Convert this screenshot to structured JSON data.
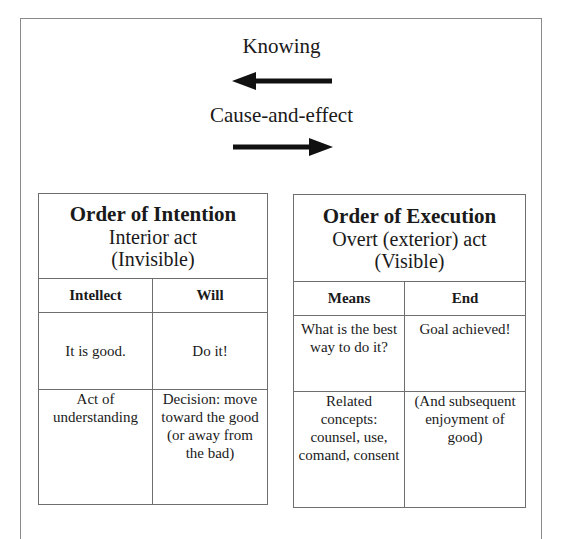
{
  "top": {
    "knowing_label": "Knowing",
    "cause_label": "Cause-and-effect",
    "arrow_left": "arrow-left-icon",
    "arrow_right": "arrow-right-icon"
  },
  "intention": {
    "title": "Order of Intention",
    "subtitle1": "Interior act",
    "subtitle2": "(Invisible)",
    "columns": [
      "Intellect",
      "Will"
    ],
    "rows": [
      [
        "It is good.",
        "Do it!"
      ],
      [
        "Act of understanding",
        "Decision: move toward the good (or away from the bad)"
      ]
    ]
  },
  "execution": {
    "title": "Order of Execution",
    "subtitle1": "Overt (exterior) act",
    "subtitle2": "(Visible)",
    "columns": [
      "Means",
      "End"
    ],
    "rows": [
      [
        "What is the best way to do it?",
        "Goal achieved!"
      ],
      [
        "Related concepts: counsel, use, comand, consent",
        "(And subsequent enjoyment of good)"
      ]
    ]
  },
  "colors": {
    "border": "#6e6e6e",
    "frame": "#8a8a8a",
    "text": "#1a1a1a",
    "arrow": "#111111"
  }
}
